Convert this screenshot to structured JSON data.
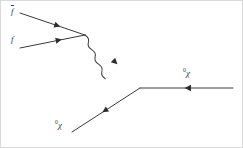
{
  "figure": {
    "kind": "feynman-diagram",
    "background_color": "#ffffff",
    "line_color": "#3a3a3a",
    "arrow_color": "#2b2b2b",
    "frame_color": "#d9d9d9",
    "width": 243,
    "height": 148
  },
  "labels": {
    "fbar": {
      "glyph": "f",
      "overbar": true,
      "superscript": ""
    },
    "f": {
      "glyph": "f",
      "overbar": false,
      "superscript": ""
    },
    "chi_in": {
      "glyph": "χ",
      "overbar": false,
      "superscript": "0"
    },
    "chi_out": {
      "glyph": "χ",
      "overbar": false,
      "superscript": "0"
    }
  },
  "vertices": [
    {
      "name": "upper-vertex",
      "x": 85,
      "y": 35
    },
    {
      "name": "lower-vertex",
      "x": 140,
      "y": 88
    }
  ],
  "legs": [
    {
      "name": "fbar-leg",
      "type": "fermion",
      "from": {
        "x": 20,
        "y": 13
      },
      "to": {
        "x": 85,
        "y": 35
      },
      "arrow_at": 0.52,
      "arrow_direction": "toward-vertex",
      "label": "fbar"
    },
    {
      "name": "f-leg",
      "type": "fermion",
      "from": {
        "x": 20,
        "y": 48
      },
      "to": {
        "x": 85,
        "y": 35
      },
      "arrow_at": 0.55,
      "arrow_direction": "toward-vertex",
      "label": "f"
    },
    {
      "name": "chi-in-leg",
      "type": "fermion",
      "from": {
        "x": 72,
        "y": 132
      },
      "to": {
        "x": 140,
        "y": 88
      },
      "arrow_at": 0.52,
      "arrow_direction": "toward-lower-left",
      "label": "chi_in"
    },
    {
      "name": "chi-out-leg",
      "type": "fermion",
      "from": {
        "x": 140,
        "y": 88
      },
      "to": {
        "x": 233,
        "y": 88
      },
      "arrow_at": 0.52,
      "arrow_direction": "leftward",
      "label": "chi_out"
    }
  ],
  "propagator": {
    "name": "boson-propagator",
    "type": "wavy",
    "from": {
      "x": 85,
      "y": 35
    },
    "to": {
      "x": 140,
      "y": 88
    },
    "wavelength": 11,
    "amplitude": 5,
    "arrow_at": 0.5,
    "arrow_direction": "toward-lower-vertex"
  }
}
